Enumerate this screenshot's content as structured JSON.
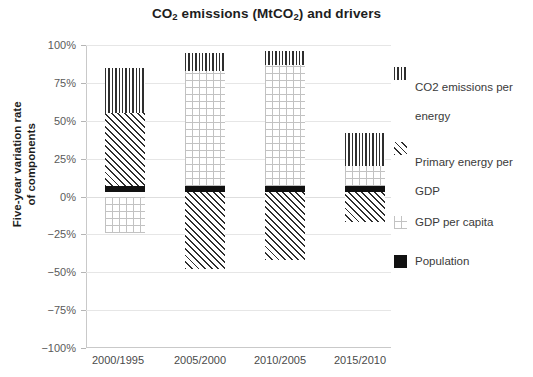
{
  "chart_data": {
    "type": "bar",
    "subtype": "stacked-bar-with-negative",
    "title": "CO2 emissions (MtCO2) and drivers",
    "title_parts": {
      "pre": "CO",
      "sub1": "2",
      "mid": " emissions (MtCO",
      "sub2": "2",
      "post": ") and drivers"
    },
    "xlabel": "",
    "ylabel": "Five-year variation rate\nof components",
    "ylabel_line1": "Five-year variation rate",
    "ylabel_line2": "of components",
    "categories": [
      "2000/1995",
      "2005/2000",
      "2010/2005",
      "2015/2010"
    ],
    "ylim": [
      -100,
      100
    ],
    "ytick_labels": [
      "100%",
      "75%",
      "50%",
      "25%",
      "0%",
      "−25%",
      "−50%",
      "−75%",
      "−100%"
    ],
    "ytick_values": [
      100,
      75,
      50,
      25,
      0,
      -25,
      -50,
      -75,
      -100
    ],
    "grid": true,
    "legend_position": "right",
    "series": [
      {
        "name": "CO2 emissions per energy",
        "label_line1": "CO2 emissions per",
        "label_line2": "energy",
        "pattern": "vertical-lines",
        "values": [
          30,
          12,
          9,
          22
        ],
        "segments": [
          {
            "category": "2000/1995",
            "from": 55,
            "to": 85
          },
          {
            "category": "2005/2000",
            "from": 83,
            "to": 95
          },
          {
            "category": "2010/2005",
            "from": 87,
            "to": 96
          },
          {
            "category": "2015/2010",
            "from": 20,
            "to": 42
          }
        ]
      },
      {
        "name": "Primary energy per GDP",
        "label_line1": "Primary energy per",
        "label_line2": "GDP",
        "pattern": "diagonal-lines",
        "values": [
          48,
          -51,
          -45,
          -20
        ],
        "segments": [
          {
            "category": "2000/1995",
            "from": 7,
            "to": 55
          },
          {
            "category": "2005/2000",
            "from": 3,
            "to": -48
          },
          {
            "category": "2010/2005",
            "from": 3,
            "to": -42
          },
          {
            "category": "2015/2010",
            "from": 3,
            "to": -17
          }
        ]
      },
      {
        "name": "GDP per capita",
        "label_line1": "GDP per capita",
        "label_line2": "",
        "pattern": "light-crosshatch",
        "values": [
          -24,
          76,
          80,
          13
        ],
        "segments": [
          {
            "category": "2000/1995",
            "from": 0,
            "to": -24
          },
          {
            "category": "2005/2000",
            "from": 7,
            "to": 83
          },
          {
            "category": "2010/2005",
            "from": 7,
            "to": 87
          },
          {
            "category": "2015/2010",
            "from": 7,
            "to": 20
          }
        ]
      },
      {
        "name": "Population",
        "label_line1": "Population",
        "label_line2": "",
        "pattern": "solid-black",
        "values": [
          4,
          4,
          4,
          4
        ],
        "segments": [
          {
            "category": "2000/1995",
            "from": 3,
            "to": 7
          },
          {
            "category": "2005/2000",
            "from": 3,
            "to": 7
          },
          {
            "category": "2010/2005",
            "from": 3,
            "to": 7
          },
          {
            "category": "2015/2010",
            "from": 3,
            "to": 7
          }
        ]
      }
    ],
    "colors": {
      "ink": "#2e2e2e",
      "population": "#111111",
      "gdp_hatch": "#c2c2c2",
      "grid": "#e6e6e6",
      "axis": "#c9c9c9"
    }
  },
  "legend": {
    "items": [
      {
        "name": "legend-co2-per-energy",
        "line1": "CO2 emissions per",
        "line2": "energy",
        "swatch": "vertical-lines-swatch"
      },
      {
        "name": "legend-energy-per-gdp",
        "line1": "Primary energy per",
        "line2": "GDP",
        "swatch": "diagonal-lines-swatch"
      },
      {
        "name": "legend-gdp-per-capita",
        "line1": "GDP per capita",
        "line2": "",
        "swatch": "crosshatch-swatch"
      },
      {
        "name": "legend-population",
        "line1": "Population",
        "line2": "",
        "swatch": "solid-black-swatch"
      }
    ]
  }
}
